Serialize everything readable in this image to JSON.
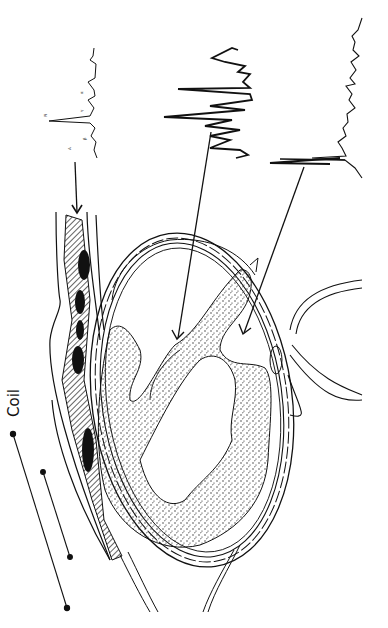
{
  "figure": {
    "orientation": "rotated-90-ccw",
    "style": "black-and-white line drawing",
    "ink_color": "#111111",
    "background_color": "#ffffff"
  },
  "labels": {
    "coil": "Coil"
  },
  "spectra": [
    {
      "id": "spectrum-1",
      "description": "sharp narrow-peak spectrum with small peak labels",
      "peak_labels": [
        "",
        "",
        "",
        ""
      ],
      "points_to": "chest wall / coil region"
    },
    {
      "id": "spectrum-2",
      "description": "broad oscillating spectrum",
      "points_to": "myocardium"
    },
    {
      "id": "spectrum-3",
      "description": "noisy spectrum with tall sharp peaks",
      "points_to": "ventricular cavity"
    }
  ],
  "anatomy": {
    "structures": [
      "chest wall layers",
      "hatched muscle band",
      "heart cross-section",
      "ventricular cavity",
      "trabeculated myocardium",
      "great vessel"
    ]
  }
}
